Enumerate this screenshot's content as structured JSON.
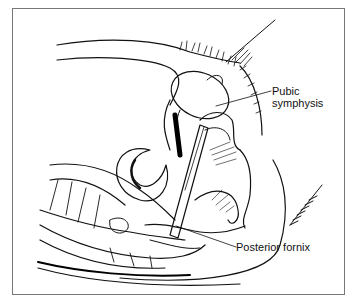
{
  "figure": {
    "type": "anatomical line illustration",
    "view": "sagittal section of female pelvis"
  },
  "labels": {
    "pubic_symphysis": [
      "Pubic",
      "symphysis"
    ],
    "posterior_fornix": "Posterior fornix"
  }
}
